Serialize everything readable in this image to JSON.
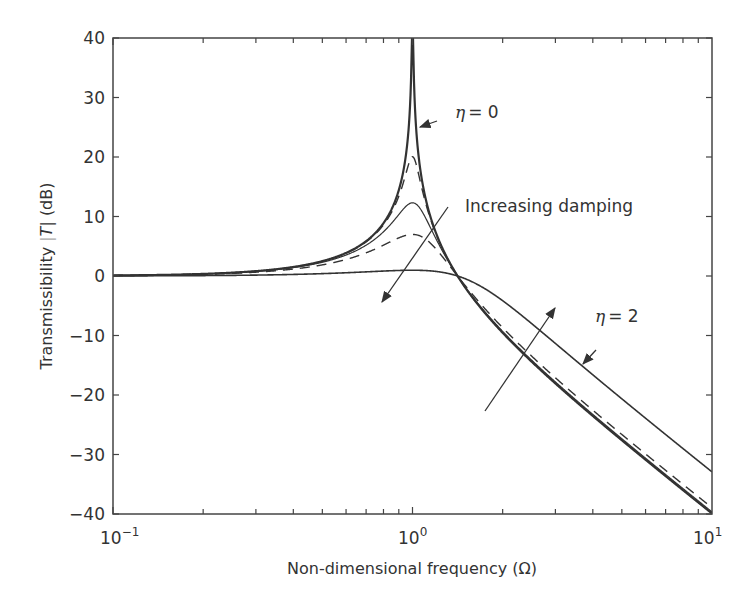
{
  "chart_data": {
    "type": "line",
    "title": "",
    "xlabel": "Non-dimensional frequency (Ω)",
    "ylabel": "Transmissibility |T| (dB)",
    "xscale": "log",
    "xlim": [
      0.1,
      10
    ],
    "ylim": [
      -40,
      40
    ],
    "grid": false,
    "legend": null,
    "x_tick_labels": [
      {
        "base": "10",
        "exp": "−1"
      },
      {
        "base": "10",
        "exp": "0"
      },
      {
        "base": "10",
        "exp": "1"
      }
    ],
    "y_tick_labels": [
      "40",
      "30",
      "20",
      "10",
      "0",
      "−10",
      "−20",
      "−30",
      "−40"
    ],
    "formula": "T = sqrt((1+η²)/((1−Ω²)²+η²))",
    "series": [
      {
        "name": "η = 0",
        "eta": 0,
        "style": "solid",
        "width": 2.2,
        "peak_db": 40
      },
      {
        "name": "η = 0.1",
        "eta": 0.1,
        "style": "dashed",
        "width": 1.4,
        "peak_db": 20
      },
      {
        "name": "η = 0.25",
        "eta": 0.25,
        "style": "solid",
        "width": 1.2,
        "peak_db": 14
      },
      {
        "name": "η = 0.5",
        "eta": 0.5,
        "style": "dashed",
        "width": 1.4,
        "peak_db": 6
      },
      {
        "name": "η = 2",
        "eta": 2,
        "style": "solid",
        "width": 1.6,
        "peak_db": 1
      }
    ],
    "annotations": [
      {
        "text": "η = 0",
        "label_eta": "η",
        "label_rest": " = 0",
        "points_to": "η = 0 curve near Ω≈1.03, 28 dB"
      },
      {
        "text": "Increasing damping",
        "note": "double-headed arrow crossing curves"
      },
      {
        "text": "η = 2",
        "label_eta": "η",
        "label_rest": " = 2",
        "points_to": "η = 2 curve near Ω≈3.5, −21 dB"
      }
    ]
  },
  "labels": {
    "eta0_sym": "η",
    "eta0_rest": "= 0",
    "eta2_sym": "η",
    "eta2_rest": "= 2",
    "increasing": "Increasing damping",
    "xlabel": "Non-dimensional frequency (Ω)",
    "ylabel_a": "Transmissibility ",
    "ylabel_t": "T",
    "ylabel_b": " (dB)"
  }
}
